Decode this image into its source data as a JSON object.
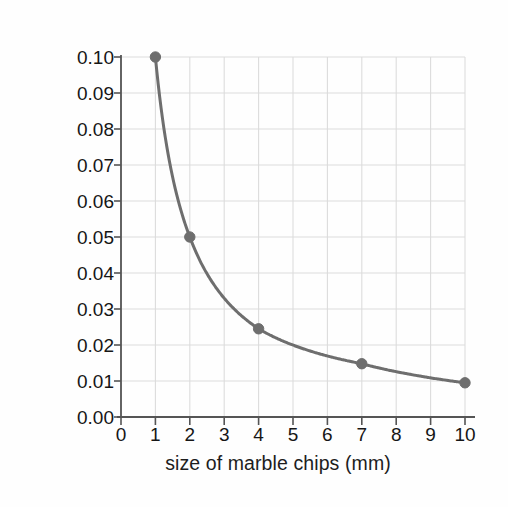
{
  "chart_data": {
    "type": "line",
    "title": "",
    "subtitle": "",
    "xlabel": "size of marble chips (mm)",
    "ylabel": "rate of carbon dioxide production (g/s)",
    "xlim": [
      0,
      10
    ],
    "ylim": [
      0.0,
      0.1
    ],
    "xticks": [
      0,
      1,
      2,
      3,
      4,
      5,
      6,
      7,
      8,
      9,
      10
    ],
    "xtick_labels": [
      "0",
      "1",
      "2",
      "3",
      "4",
      "5",
      "6",
      "7",
      "8",
      "9",
      "10"
    ],
    "yticks": [
      0.0,
      0.01,
      0.02,
      0.03,
      0.04,
      0.05,
      0.06,
      0.07,
      0.08,
      0.09,
      0.1
    ],
    "ytick_labels": [
      "0.00",
      "0.01",
      "0.02",
      "0.03",
      "0.04",
      "0.05",
      "0.06",
      "0.07",
      "0.08",
      "0.09",
      "0.10"
    ],
    "grid": true,
    "grid_color": "#dcdcdc",
    "legend": "none",
    "series": [
      {
        "name": "rate of carbon dioxide production",
        "color": "#6e6e6e",
        "marker": "circle",
        "x": [
          1,
          2,
          4,
          7,
          10
        ],
        "y": [
          0.1,
          0.05,
          0.0245,
          0.0148,
          0.0095
        ]
      }
    ],
    "annotations": []
  },
  "figure": {
    "background_color": "#fefefe",
    "axis_color": "#555555",
    "text_color": "#161616"
  }
}
